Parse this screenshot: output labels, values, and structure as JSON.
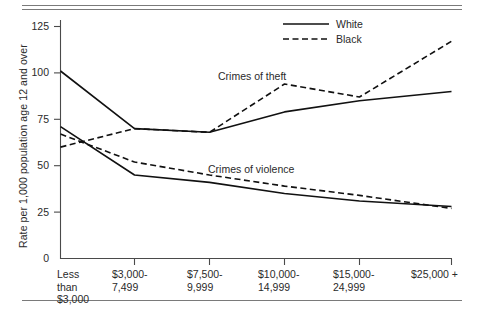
{
  "figure": {
    "y_axis_title": "Rate per 1,000 population age 12 and over",
    "annotation_theft": "Crimes of theft",
    "annotation_violence": "Crimes of violence"
  },
  "legend": {
    "position": "top-right",
    "entries": [
      {
        "label": "White",
        "style": "solid"
      },
      {
        "label": "Black",
        "style": "dashed"
      }
    ]
  },
  "chart_data": {
    "type": "line",
    "title": "",
    "subtitle": "",
    "xlabel": "",
    "ylabel": "Rate per 1,000 population age 12 and over",
    "categories": [
      "Less\nthan\n$3,000",
      "$3,000-\n7,499",
      "$7,500-\n9,999",
      "$10,000-\n14,999",
      "$15,000-\n24,999",
      "$25,000 +"
    ],
    "category_labels_flat": [
      "Less than $3,000",
      "$3,000-7,499",
      "$7,500-9,999",
      "$10,000-14,999",
      "$15,000-24,999",
      "$25,000 +"
    ],
    "ylim": [
      0,
      125
    ],
    "yticks": [
      0,
      25,
      50,
      75,
      100,
      125
    ],
    "ytick_labels": [
      "0",
      "25",
      "50",
      "75",
      "100",
      "125"
    ],
    "grid": false,
    "legend_position": "top right",
    "annotations": [
      {
        "text": "Crimes of theft",
        "x_category_index": 2,
        "y": 104
      },
      {
        "text": "Crimes of violence",
        "x_category_index": 2,
        "y": 54
      }
    ],
    "series": [
      {
        "name": "Crimes of theft — White",
        "group": "Crimes of theft",
        "race": "White",
        "style": "solid",
        "values": [
          101,
          70,
          68,
          79,
          85,
          90
        ]
      },
      {
        "name": "Crimes of theft — Black",
        "group": "Crimes of theft",
        "race": "Black",
        "style": "dashed",
        "values": [
          60,
          70,
          68,
          94,
          87,
          117
        ]
      },
      {
        "name": "Crimes of violence — White",
        "group": "Crimes of violence",
        "race": "White",
        "style": "solid",
        "values": [
          71,
          45,
          41,
          35,
          31,
          28
        ]
      },
      {
        "name": "Crimes of violence — Black",
        "group": "Crimes of violence",
        "race": "Black",
        "style": "dashed",
        "values": [
          67,
          52,
          45,
          39,
          34,
          27
        ]
      }
    ]
  },
  "colors": {
    "line": "#111111",
    "axis": "#4a4a4a",
    "rule": "#7a7a7a",
    "text": "#2a2a2a",
    "background": "#ffffff"
  }
}
